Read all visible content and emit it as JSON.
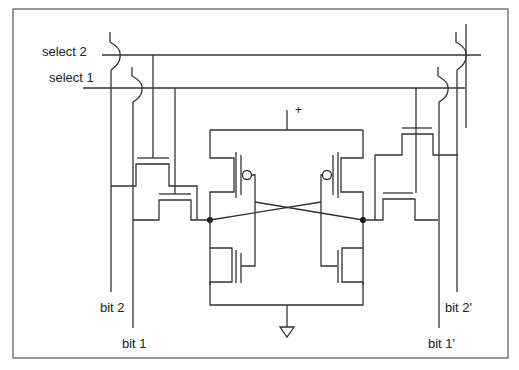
{
  "diagram": {
    "type": "circuit-schematic",
    "labels": {
      "select2": "select 2",
      "select1": "select 1",
      "bit2": "bit 2",
      "bit1": "bit 1",
      "bit2_prime": "bit 2'",
      "bit1_prime": "bit 1'",
      "supply": "+"
    },
    "components": [
      {
        "name": "pmos-left",
        "kind": "PMOS transistor"
      },
      {
        "name": "pmos-right",
        "kind": "PMOS transistor"
      },
      {
        "name": "nmos-left",
        "kind": "NMOS transistor"
      },
      {
        "name": "nmos-right",
        "kind": "NMOS transistor"
      },
      {
        "name": "access-left-port1",
        "kind": "NMOS pass transistor"
      },
      {
        "name": "access-left-port2",
        "kind": "NMOS pass transistor"
      },
      {
        "name": "access-right-port1",
        "kind": "NMOS pass transistor"
      },
      {
        "name": "access-right-port2",
        "kind": "NMOS pass transistor"
      },
      {
        "name": "ground",
        "kind": "ground symbol"
      },
      {
        "name": "vdd",
        "kind": "supply terminal"
      }
    ],
    "colors": {
      "wire": "#333333",
      "frame": "#555555",
      "background": "#ffffff"
    }
  }
}
